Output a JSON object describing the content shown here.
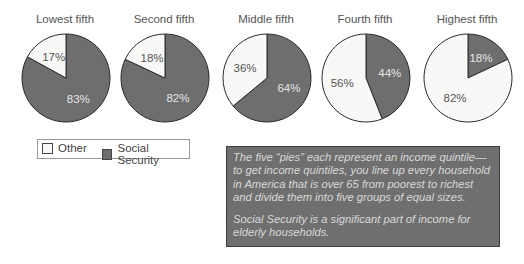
{
  "chart_data": {
    "type": "pie",
    "title": "",
    "categories": [
      "Lowest fifth",
      "Second fifth",
      "Middle fifth",
      "Fourth fifth",
      "Highest fifth"
    ],
    "series": [
      {
        "name": "Social Security",
        "values": [
          83,
          82,
          64,
          44,
          18
        ],
        "color": "#6e6e6e"
      },
      {
        "name": "Other",
        "values": [
          17,
          18,
          36,
          56,
          82
        ],
        "color": "#f8f8f6"
      }
    ],
    "legend": {
      "position": "bottom-left",
      "entries": [
        "Other",
        "Social Security"
      ]
    }
  },
  "pies": [
    {
      "title": "Lowest fifth",
      "ss": 83,
      "other": 17,
      "ss_label": "83%",
      "other_label": "17%"
    },
    {
      "title": "Second fifth",
      "ss": 82,
      "other": 18,
      "ss_label": "82%",
      "other_label": "18%"
    },
    {
      "title": "Middle fifth",
      "ss": 64,
      "other": 36,
      "ss_label": "64%",
      "other_label": "36%"
    },
    {
      "title": "Fourth fifth",
      "ss": 44,
      "other": 56,
      "ss_label": "44%",
      "other_label": "56%"
    },
    {
      "title": "Highest fifth",
      "ss": 18,
      "other": 82,
      "ss_label": "18%",
      "other_label": "82%"
    }
  ],
  "legend": {
    "other": "Other",
    "social_security": "Social Security"
  },
  "note": {
    "p1": "The five “pies” each represent an income quintile—to get income quintiles, you line up every household in America that is over 65 from poorest to richest and divide them into five groups of equal sizes.",
    "p2": "Social Security is a significant part of income for elderly households."
  },
  "colors": {
    "social_security": "#6e6e6e",
    "other": "#f8f8f6",
    "outline": "#2a2a2a"
  }
}
